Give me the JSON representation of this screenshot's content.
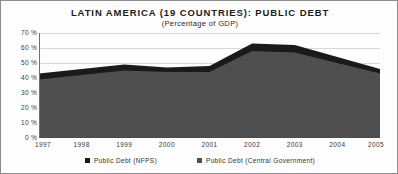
{
  "chart_data": {
    "type": "area",
    "title": "LATIN AMERICA (19 COUNTRIES): PUBLIC DEBT",
    "subtitle": "(Percentage of GDP)",
    "xlabel": "",
    "ylabel": "",
    "stacked": false,
    "grid": true,
    "legend_position": "bottom",
    "ylim": [
      0,
      70
    ],
    "xlim": [
      "1997",
      "2005"
    ],
    "categories": [
      "1997",
      "1998",
      "1999",
      "2000",
      "2001",
      "2002",
      "2003",
      "2004",
      "2005"
    ],
    "x": [
      "1997",
      "1998",
      "1999",
      "2000",
      "2001",
      "2002",
      "2003",
      "2004",
      "2005"
    ],
    "ytick_labels": [
      "70 %",
      "60 %",
      "50 %",
      "40 %",
      "30 %",
      "20 %",
      "10 %",
      "0 %"
    ],
    "ytick_values": [
      70,
      60,
      50,
      40,
      30,
      20,
      10,
      0
    ],
    "xtick_labels": [
      "1997",
      "1998",
      "1999",
      "2000",
      "2001",
      "2002",
      "2003",
      "2004",
      "2005"
    ],
    "series": [
      {
        "name": "Public Debt (NFPS)",
        "color": "#1a1a1a",
        "values": [
          43,
          46,
          49,
          47,
          48,
          63,
          62,
          54,
          46
        ]
      },
      {
        "name": "Public Debt (Central Government)",
        "color": "#4f4f4f",
        "values": [
          39,
          42,
          45,
          44,
          44,
          58,
          57,
          50,
          43
        ]
      }
    ]
  },
  "legend": {
    "items": [
      {
        "label": "Public Debt (NFPS)",
        "color": "#1a1a1a"
      },
      {
        "label": "Public Debt (Central Government)",
        "color": "#4f4f4f"
      }
    ]
  },
  "colors": {
    "nfps": "#1a1a1a",
    "central_government": "#4f4f4f",
    "grid": "#d7d7d7",
    "axis": "#5a5a5a",
    "border": "#8d8d8d",
    "text": "#333333",
    "background": "#fdfdfd"
  }
}
